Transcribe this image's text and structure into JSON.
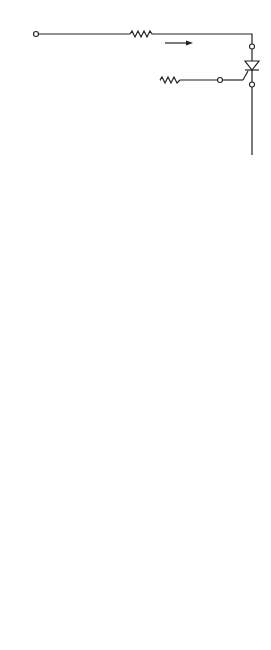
{
  "circuit": {
    "caption": "(a)",
    "nodes": {
      "L": "L",
      "A": "A",
      "K": "K",
      "C": "C",
      "G": "G"
    },
    "resistor_R": "R",
    "resistor_RG": {
      "main": "R",
      "sub": "G"
    },
    "vr_label": {
      "minus": "−",
      "main": "V",
      "sub": "R",
      "plus": "+"
    },
    "ir_label": {
      "main": "I",
      "sub": "R"
    },
    "ig_label": {
      "main": "I",
      "sub": "G"
    },
    "source_vlk": {
      "main": "V",
      "sub": "LK",
      "plus": "+",
      "minus": "−"
    },
    "source_vck": {
      "main": "V",
      "sub": "CK",
      "plus": "+",
      "minus": "−"
    }
  },
  "waveforms": {
    "caption": "(b)",
    "time_label": "Time",
    "ton_label": {
      "main": "t",
      "sub": "on"
    },
    "toff_label": {
      "main": "t",
      "sub": "off"
    },
    "traces": [
      {
        "main": "V",
        "sub": "LK"
      },
      {
        "main": "V",
        "sub": "CK"
      },
      {
        "main": "V",
        "sub": "AK"
      },
      {
        "main": "I",
        "sub": "R"
      },
      {
        "main": "V",
        "sub": "R"
      }
    ]
  }
}
